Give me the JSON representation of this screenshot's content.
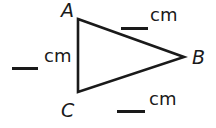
{
  "figure": {
    "type": "geometry-triangle-worksheet",
    "background_color": "#ffffff",
    "stroke_color": "#1a1a1a",
    "canvas": {
      "width": 216,
      "height": 128
    },
    "triangle": {
      "vertices": [
        {
          "name": "A",
          "label": "A",
          "x": 78,
          "y": 19
        },
        {
          "name": "B",
          "label": "B",
          "x": 184,
          "y": 57
        },
        {
          "name": "C",
          "label": "C",
          "x": 78,
          "y": 92
        }
      ],
      "path": "M 78 19 L 184 57 L 78 92 Z",
      "stroke_width": 2.6
    },
    "vertex_labels": [
      {
        "id": "A",
        "text": "A",
        "style": "italic"
      },
      {
        "id": "B",
        "text": "B",
        "style": "italic"
      },
      {
        "id": "C",
        "text": "C",
        "style": "italic"
      }
    ],
    "measurements": [
      {
        "id": "side-AB",
        "position": "top",
        "blank_value": "",
        "unit": "cm"
      },
      {
        "id": "side-AC",
        "position": "left",
        "blank_value": "",
        "unit": "cm"
      },
      {
        "id": "side-CB",
        "position": "bottom",
        "blank_value": "",
        "unit": "cm"
      }
    ]
  }
}
